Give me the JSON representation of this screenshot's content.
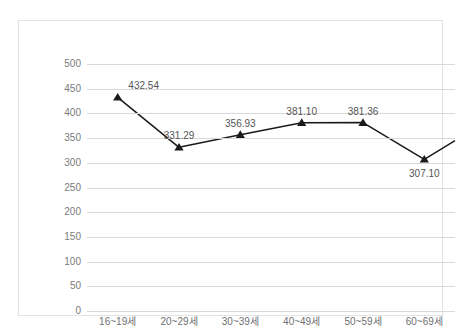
{
  "chart_data": {
    "type": "line",
    "title": "",
    "subtitle": "",
    "xlabel": "",
    "ylabel": "",
    "categories": [
      "16~19세",
      "20~29세",
      "30~39세",
      "40~49세",
      "50~59세",
      "60~69세"
    ],
    "values": [
      432.54,
      331.29,
      356.93,
      381.1,
      381.36,
      307.1
    ],
    "data_labels": [
      "432.54",
      "331.29",
      "356.93",
      "381.10",
      "381.36",
      "307.10"
    ],
    "series": [
      {
        "name": "",
        "values": [
          432.54,
          331.29,
          356.93,
          381.1,
          381.36,
          307.1
        ]
      }
    ],
    "ylim": [
      0,
      500
    ],
    "ytick_step": 50,
    "ytick_labels": [
      "500",
      "450",
      "400",
      "350",
      "300",
      "250",
      "200",
      "150",
      "100",
      "50",
      "0"
    ],
    "ytick_values": [
      500,
      450,
      400,
      350,
      300,
      250,
      200,
      150,
      100,
      50,
      0
    ],
    "grid": "horizontal",
    "legend": "none",
    "marker": "triangle",
    "line_color": "#1a1a1a",
    "marker_color": "#1a1a1a",
    "grid_color": "#d9d9d9",
    "label_color": "#555555",
    "tick_color": "#7b7b7b",
    "border_color": "#e2e2e2",
    "background": "#ffffff",
    "trailing_edge_value": 345
  }
}
